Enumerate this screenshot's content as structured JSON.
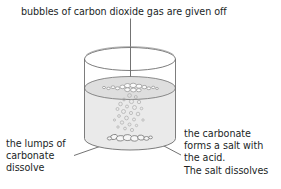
{
  "diagram": {
    "title_callout": "bubbles of carbon dioxide gas are given off",
    "left_callout": "the lumps of\ncarbonate\ndissolve",
    "right_callout": "the carbonate\nforms a salt with\nthe acid.\nThe salt dissolves",
    "colors": {
      "text": "#221f1f",
      "outline": "#6e6e6e",
      "liquid": "#eaeaea",
      "liquid_surface": "#dcdcdc",
      "lump_fill": "#f4f4f4",
      "leader_line": "#4f4f4f",
      "background": "#ffffff"
    },
    "elements": {
      "beaker": "glass-beaker",
      "liquid": "acid-solution",
      "surface_bubbles": "carbon-dioxide-bubbles-at-surface",
      "rising_bubbles": "rising-gas-bubbles",
      "lumps": "carbonate-lumps-at-base"
    }
  }
}
